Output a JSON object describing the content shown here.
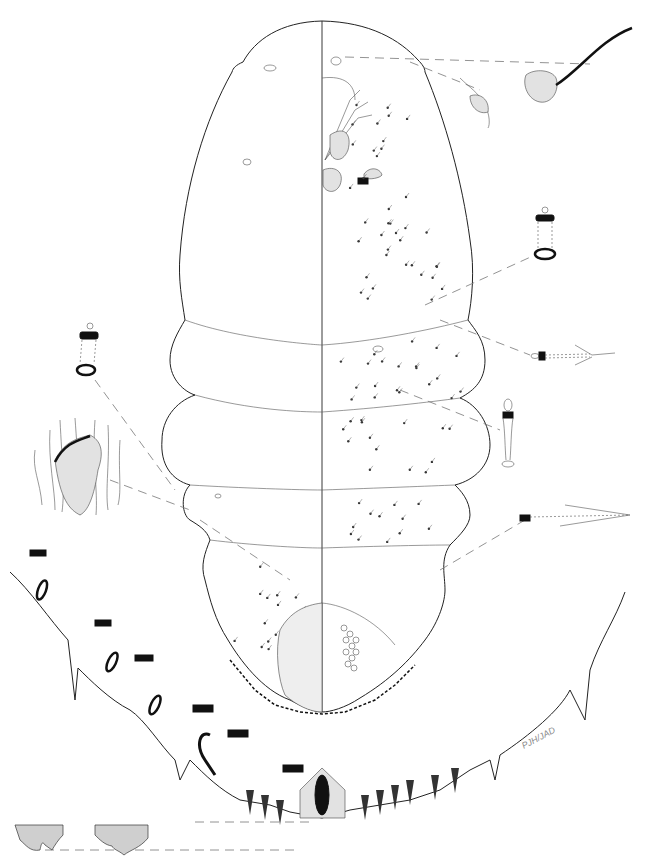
{
  "figure": {
    "signature": "PJH/JAD",
    "colors": {
      "background": "#ffffff",
      "ink": "#222222",
      "leader_lines": "#777777"
    },
    "insets": [
      {
        "name": "antenna-detail"
      },
      {
        "name": "spiracle-detail"
      },
      {
        "name": "dorsal-duct-upper-right"
      },
      {
        "name": "ventral-duct-right"
      },
      {
        "name": "ventral-microduct-right"
      },
      {
        "name": "tubular-duct-right"
      },
      {
        "name": "dorsal-duct-left"
      },
      {
        "name": "derm-sclerotization-left"
      },
      {
        "name": "pygidium-margin-enlarged"
      },
      {
        "name": "median-lobes-detail"
      }
    ]
  }
}
